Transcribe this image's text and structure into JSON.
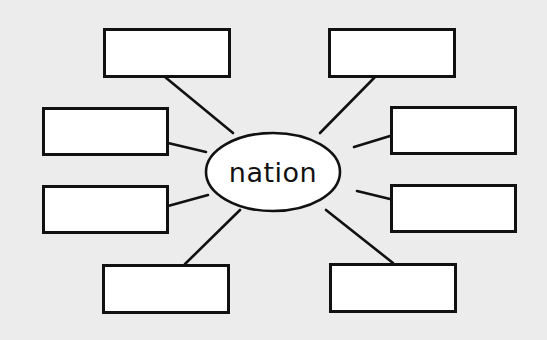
{
  "diagram": {
    "type": "word-web",
    "center": {
      "label": "nation",
      "cx": 273,
      "cy": 172,
      "rx": 67,
      "ry": 39
    },
    "colors": {
      "background": "#ececec",
      "box_fill": "#ffffff",
      "stroke": "#111111"
    },
    "boxes": [
      {
        "id": "top-left",
        "x": 103,
        "y": 28,
        "w": 128,
        "h": 50,
        "text": "",
        "connect": [
          165,
          77,
          233,
          133
        ]
      },
      {
        "id": "top-right",
        "x": 328,
        "y": 28,
        "w": 128,
        "h": 50,
        "text": "",
        "connect": [
          375,
          77,
          320,
          133
        ]
      },
      {
        "id": "mid-left-upper",
        "x": 42,
        "y": 107,
        "w": 127,
        "h": 49,
        "text": "",
        "connect": [
          168,
          143,
          206,
          152
        ]
      },
      {
        "id": "mid-right-upper",
        "x": 390,
        "y": 106,
        "w": 127,
        "h": 49,
        "text": "",
        "connect": [
          390,
          136,
          354,
          147
        ]
      },
      {
        "id": "mid-left-lower",
        "x": 42,
        "y": 185,
        "w": 127,
        "h": 49,
        "text": "",
        "connect": [
          168,
          206,
          208,
          195
        ]
      },
      {
        "id": "mid-right-lower",
        "x": 390,
        "y": 184,
        "w": 127,
        "h": 49,
        "text": "",
        "connect": [
          390,
          199,
          357,
          191
        ]
      },
      {
        "id": "bottom-left",
        "x": 102,
        "y": 264,
        "w": 128,
        "h": 50,
        "text": "",
        "connect": [
          185,
          264,
          240,
          210
        ]
      },
      {
        "id": "bottom-right",
        "x": 329,
        "y": 263,
        "w": 128,
        "h": 50,
        "text": "",
        "connect": [
          393,
          263,
          326,
          210
        ]
      }
    ]
  }
}
